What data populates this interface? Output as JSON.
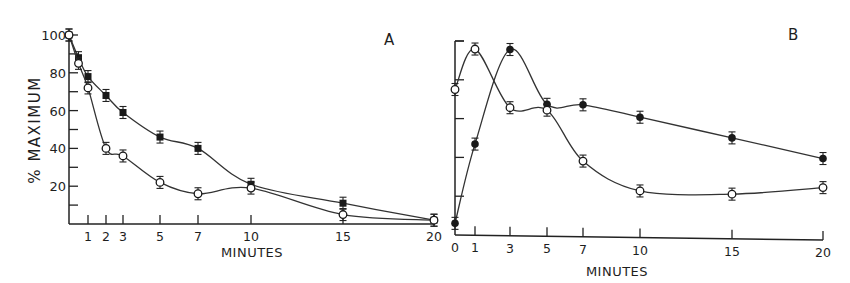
{
  "figure": {
    "ylabel": "% MAXIMUM",
    "xlabel_a": "MINUTES",
    "xlabel_b": "MINUTES",
    "panel_a_label": "A",
    "panel_b_label": "B"
  },
  "chart_data": [
    {
      "type": "line",
      "panel": "A",
      "title": "A",
      "xlabel": "MINUTES",
      "ylabel": "% MAXIMUM",
      "xticks": [
        1,
        2,
        3,
        5,
        7,
        10,
        15,
        20
      ],
      "yticks": [
        20,
        40,
        60,
        80,
        100
      ],
      "xlim": [
        0,
        20
      ],
      "ylim": [
        0,
        100
      ],
      "grid": false,
      "series": [
        {
          "name": "filled squares",
          "marker": "filled-square",
          "x": [
            0,
            0.5,
            1,
            2,
            3,
            5,
            7,
            10,
            15,
            20
          ],
          "values": [
            100,
            88,
            78,
            68,
            59,
            46,
            40,
            21,
            11,
            2
          ]
        },
        {
          "name": "open circles",
          "marker": "open-circle",
          "x": [
            0,
            0.5,
            1,
            2,
            3,
            5,
            7,
            10,
            15,
            20
          ],
          "values": [
            100,
            85,
            72,
            40,
            36,
            22,
            16,
            19,
            5,
            2
          ]
        }
      ]
    },
    {
      "type": "line",
      "panel": "B",
      "title": "B",
      "xlabel": "MINUTES",
      "ylabel": "% MAXIMUM",
      "xticks": [
        0,
        1,
        3,
        5,
        7,
        10,
        15,
        20
      ],
      "yticks": [
        20,
        40,
        60,
        80,
        100
      ],
      "ytick_labels_shown": false,
      "xlim": [
        0,
        20
      ],
      "ylim": [
        0,
        100
      ],
      "grid": false,
      "series": [
        {
          "name": "filled circles",
          "marker": "filled-circle",
          "x": [
            0,
            1,
            3,
            5,
            7,
            10,
            15,
            20
          ],
          "values": [
            6,
            47,
            96,
            68,
            68,
            62,
            52,
            42
          ]
        },
        {
          "name": "open circles",
          "marker": "open-circle",
          "x": [
            0,
            1,
            3,
            5,
            7,
            10,
            15,
            20
          ],
          "values": [
            75,
            96,
            66,
            65,
            39,
            24,
            23,
            27
          ]
        }
      ]
    }
  ]
}
